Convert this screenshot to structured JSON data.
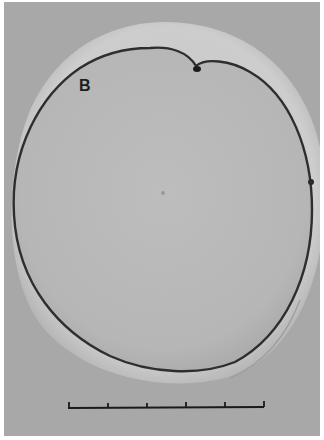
{
  "figure": {
    "panel_label": "B",
    "scale_bar": {
      "ticks": 6,
      "segments": 5,
      "x_start": 68,
      "x_end": 264,
      "y": 406
    },
    "colors": {
      "background": "#a9a9a9",
      "outer_ring": "#c9c9c9",
      "cell_body": "#b8b8b8",
      "outline": "#2a2a2a",
      "border": "#ffffff"
    }
  }
}
